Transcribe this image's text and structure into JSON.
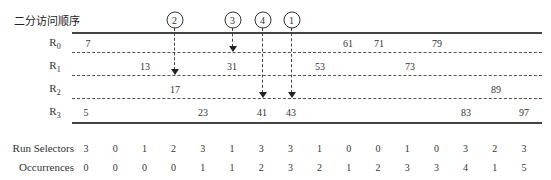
{
  "title": "二分访问顺序",
  "rows": [
    {
      "label_base": "R",
      "label_sub": "0",
      "values": [
        {
          "v": "7",
          "x": 88
        },
        {
          "v": "61",
          "x": 348
        },
        {
          "v": "71",
          "x": 379
        },
        {
          "v": "79",
          "x": 437
        }
      ]
    },
    {
      "label_base": "R",
      "label_sub": "1",
      "values": [
        {
          "v": "13",
          "x": 145
        },
        {
          "v": "31",
          "x": 232
        },
        {
          "v": "53",
          "x": 320
        },
        {
          "v": "73",
          "x": 410
        }
      ]
    },
    {
      "label_base": "R",
      "label_sub": "2",
      "values": [
        {
          "v": "17",
          "x": 175
        },
        {
          "v": "89",
          "x": 496
        }
      ]
    },
    {
      "label_base": "R",
      "label_sub": "3",
      "values": [
        {
          "v": "5",
          "x": 86
        },
        {
          "v": "23",
          "x": 203
        },
        {
          "v": "41",
          "x": 262
        },
        {
          "v": "43",
          "x": 291
        },
        {
          "v": "83",
          "x": 466
        },
        {
          "v": "97",
          "x": 524
        }
      ]
    }
  ],
  "access_order": [
    {
      "label": "2",
      "x": 174,
      "target_row": 2
    },
    {
      "label": "3",
      "x": 232,
      "target_row": 1
    },
    {
      "label": "4",
      "x": 262,
      "target_row": 3
    },
    {
      "label": "1",
      "x": 291,
      "target_row": 3
    }
  ],
  "table": {
    "run_selectors_label": "Run Selectors",
    "occurrences_label": "Occurrences",
    "run_selectors": [
      "3",
      "0",
      "1",
      "2",
      "3",
      "1",
      "3",
      "3",
      "1",
      "0",
      "0",
      "1",
      "0",
      "3",
      "2",
      "3"
    ],
    "occurrences": [
      "0",
      "0",
      "0",
      "0",
      "1",
      "1",
      "2",
      "3",
      "2",
      "1",
      "2",
      "3",
      "3",
      "4",
      "1",
      "5"
    ]
  }
}
